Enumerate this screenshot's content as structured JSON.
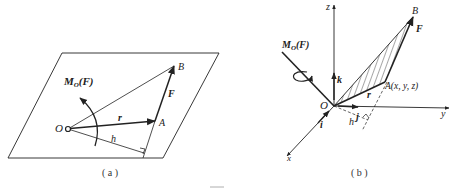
{
  "figure": {
    "panel_a": {
      "caption": "( a )",
      "moment_label": "M",
      "moment_sub": "O",
      "moment_arg": "(F)",
      "point_O": "O",
      "point_A": "A",
      "point_B": "B",
      "force_label": "F",
      "position_label": "r",
      "arm_label": "h"
    },
    "panel_b": {
      "caption": "( b )",
      "moment_label": "M",
      "moment_sub": "O",
      "moment_arg": "(F)",
      "axis_x": "x",
      "axis_y": "y",
      "axis_z": "z",
      "unit_i": "i",
      "unit_j": "j",
      "unit_k": "k",
      "point_O": "O",
      "point_A": "A(x, y, z)",
      "point_B": "B",
      "force_label": "F",
      "position_label": "r",
      "arm_label": "h"
    },
    "colors": {
      "ink": "#222222",
      "background": "#ffffff"
    }
  }
}
